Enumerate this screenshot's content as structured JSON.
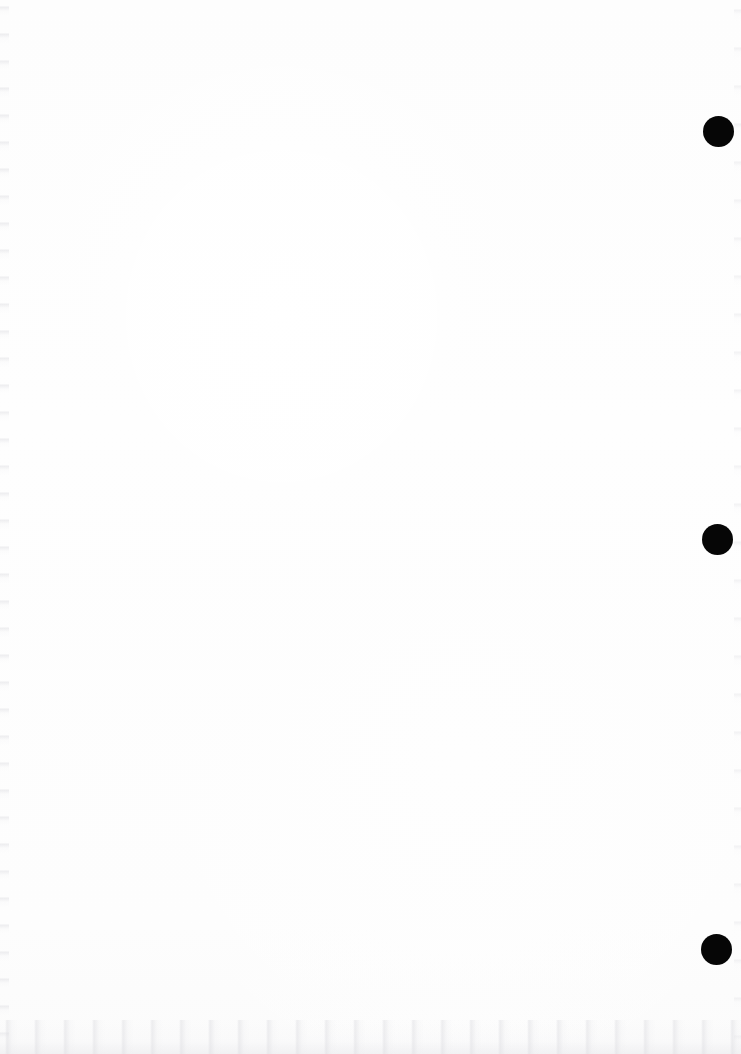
{
  "page": {
    "kind": "scanned-blank-page",
    "width": 741,
    "height": 1054,
    "background_color": "#fdfdfd",
    "content_text": ""
  },
  "marks": {
    "color": "#060606",
    "shape": "circle",
    "diameter": 31,
    "count": 3,
    "dots": [
      {
        "name": "margin-dot-top",
        "cx": 718,
        "cy": 131,
        "r": 15.5
      },
      {
        "name": "margin-dot-middle",
        "cx": 717,
        "cy": 539,
        "r": 15.5
      },
      {
        "name": "margin-dot-bottom",
        "cx": 716,
        "cy": 949,
        "r": 15.5
      }
    ]
  },
  "artifacts": {
    "bottom_edge_noise_color": "#eeeeee",
    "left_edge_noise_color": "#e4e4e6",
    "right_edge_noise_color": "#e8e8ea"
  }
}
